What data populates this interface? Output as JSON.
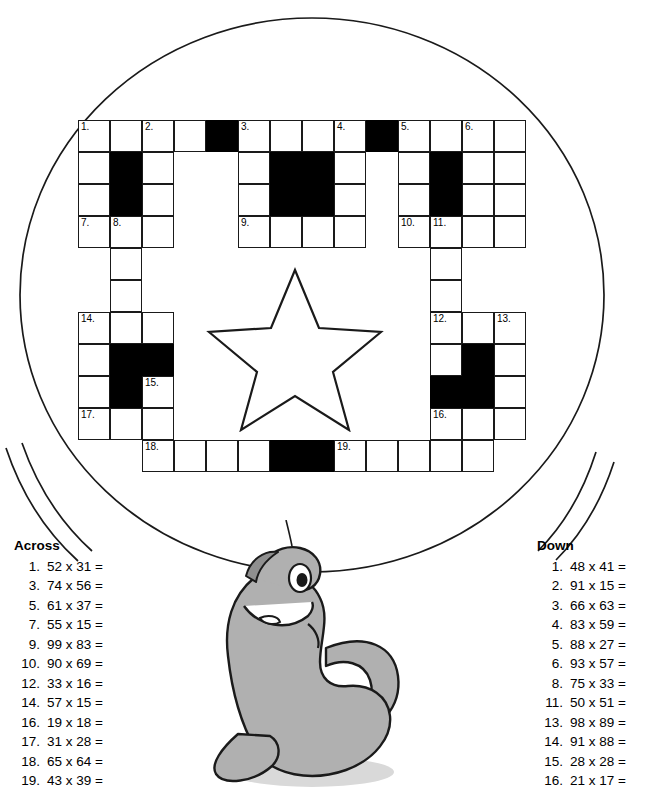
{
  "worksheet": {
    "across": {
      "heading": "Across",
      "clues": [
        {
          "n": "1.",
          "text": "52 x 31 ="
        },
        {
          "n": "3.",
          "text": "74 x 56 ="
        },
        {
          "n": "5.",
          "text": "61 x 37 ="
        },
        {
          "n": "7.",
          "text": "55 x 15 ="
        },
        {
          "n": "9.",
          "text": "99 x 83 ="
        },
        {
          "n": "10.",
          "text": "90 x 69 ="
        },
        {
          "n": "12.",
          "text": "33 x 16 ="
        },
        {
          "n": "14.",
          "text": "57 x 15 ="
        },
        {
          "n": "16.",
          "text": "19 x 18 ="
        },
        {
          "n": "17.",
          "text": "31 x 28 ="
        },
        {
          "n": "18.",
          "text": "65 x 64 ="
        },
        {
          "n": "19.",
          "text": "43 x 39 ="
        }
      ]
    },
    "down": {
      "heading": "Down",
      "clues": [
        {
          "n": "1.",
          "text": "48 x 41 ="
        },
        {
          "n": "2.",
          "text": "91 x 15 ="
        },
        {
          "n": "3.",
          "text": "66 x 63 ="
        },
        {
          "n": "4.",
          "text": "83 x 59 ="
        },
        {
          "n": "5.",
          "text": "88 x 27 ="
        },
        {
          "n": "6.",
          "text": "93 x 57 ="
        },
        {
          "n": "8.",
          "text": "75 x 33 ="
        },
        {
          "n": "11.",
          "text": "50 x 51 ="
        },
        {
          "n": "13.",
          "text": "98 x 89 ="
        },
        {
          "n": "14.",
          "text": "91 x 88 ="
        },
        {
          "n": "15.",
          "text": "28 x 28 ="
        },
        {
          "n": "16.",
          "text": "21 x 17 ="
        }
      ]
    }
  },
  "grid": {
    "origin_x": 78,
    "origin_y": 120,
    "cell": 32,
    "cols": 15,
    "rows": 11,
    "cells": [
      {
        "r": 0,
        "c": 0,
        "black": false,
        "num": "1."
      },
      {
        "r": 0,
        "c": 1,
        "black": false,
        "num": ""
      },
      {
        "r": 0,
        "c": 2,
        "black": false,
        "num": "2."
      },
      {
        "r": 0,
        "c": 3,
        "black": false,
        "num": ""
      },
      {
        "r": 0,
        "c": 4,
        "black": true,
        "num": ""
      },
      {
        "r": 0,
        "c": 5,
        "black": false,
        "num": "3."
      },
      {
        "r": 0,
        "c": 6,
        "black": false,
        "num": ""
      },
      {
        "r": 0,
        "c": 7,
        "black": false,
        "num": ""
      },
      {
        "r": 0,
        "c": 8,
        "black": false,
        "num": "4."
      },
      {
        "r": 0,
        "c": 9,
        "black": true,
        "num": ""
      },
      {
        "r": 0,
        "c": 10,
        "black": false,
        "num": "5."
      },
      {
        "r": 0,
        "c": 11,
        "black": false,
        "num": ""
      },
      {
        "r": 0,
        "c": 12,
        "black": false,
        "num": "6."
      },
      {
        "r": 0,
        "c": 13,
        "black": false,
        "num": ""
      },
      {
        "r": 1,
        "c": 0,
        "black": false,
        "num": ""
      },
      {
        "r": 1,
        "c": 1,
        "black": true,
        "num": ""
      },
      {
        "r": 1,
        "c": 2,
        "black": false,
        "num": ""
      },
      {
        "r": 1,
        "c": 5,
        "black": false,
        "num": ""
      },
      {
        "r": 1,
        "c": 6,
        "black": true,
        "num": ""
      },
      {
        "r": 1,
        "c": 7,
        "black": true,
        "num": ""
      },
      {
        "r": 1,
        "c": 8,
        "black": false,
        "num": ""
      },
      {
        "r": 1,
        "c": 10,
        "black": false,
        "num": ""
      },
      {
        "r": 1,
        "c": 11,
        "black": true,
        "num": ""
      },
      {
        "r": 1,
        "c": 12,
        "black": false,
        "num": ""
      },
      {
        "r": 1,
        "c": 13,
        "black": false,
        "num": ""
      },
      {
        "r": 2,
        "c": 0,
        "black": false,
        "num": ""
      },
      {
        "r": 2,
        "c": 1,
        "black": true,
        "num": ""
      },
      {
        "r": 2,
        "c": 2,
        "black": false,
        "num": ""
      },
      {
        "r": 2,
        "c": 5,
        "black": false,
        "num": ""
      },
      {
        "r": 2,
        "c": 6,
        "black": true,
        "num": ""
      },
      {
        "r": 2,
        "c": 7,
        "black": true,
        "num": ""
      },
      {
        "r": 2,
        "c": 8,
        "black": false,
        "num": ""
      },
      {
        "r": 2,
        "c": 10,
        "black": false,
        "num": ""
      },
      {
        "r": 2,
        "c": 11,
        "black": true,
        "num": ""
      },
      {
        "r": 2,
        "c": 12,
        "black": false,
        "num": ""
      },
      {
        "r": 2,
        "c": 13,
        "black": false,
        "num": ""
      },
      {
        "r": 3,
        "c": 0,
        "black": false,
        "num": "7."
      },
      {
        "r": 3,
        "c": 1,
        "black": false,
        "num": "8."
      },
      {
        "r": 3,
        "c": 2,
        "black": false,
        "num": ""
      },
      {
        "r": 3,
        "c": 5,
        "black": false,
        "num": "9."
      },
      {
        "r": 3,
        "c": 6,
        "black": false,
        "num": ""
      },
      {
        "r": 3,
        "c": 7,
        "black": false,
        "num": ""
      },
      {
        "r": 3,
        "c": 8,
        "black": false,
        "num": ""
      },
      {
        "r": 3,
        "c": 10,
        "black": false,
        "num": "10."
      },
      {
        "r": 3,
        "c": 11,
        "black": false,
        "num": "11."
      },
      {
        "r": 3,
        "c": 12,
        "black": false,
        "num": ""
      },
      {
        "r": 3,
        "c": 13,
        "black": false,
        "num": ""
      },
      {
        "r": 4,
        "c": 1,
        "black": false,
        "num": ""
      },
      {
        "r": 4,
        "c": 11,
        "black": false,
        "num": ""
      },
      {
        "r": 5,
        "c": 1,
        "black": false,
        "num": ""
      },
      {
        "r": 5,
        "c": 11,
        "black": false,
        "num": ""
      },
      {
        "r": 6,
        "c": 0,
        "black": false,
        "num": "14."
      },
      {
        "r": 6,
        "c": 1,
        "black": false,
        "num": ""
      },
      {
        "r": 6,
        "c": 2,
        "black": false,
        "num": ""
      },
      {
        "r": 6,
        "c": 11,
        "black": false,
        "num": "12."
      },
      {
        "r": 6,
        "c": 12,
        "black": false,
        "num": ""
      },
      {
        "r": 6,
        "c": 13,
        "black": false,
        "num": "13."
      },
      {
        "r": 7,
        "c": 0,
        "black": false,
        "num": ""
      },
      {
        "r": 7,
        "c": 1,
        "black": true,
        "num": ""
      },
      {
        "r": 7,
        "c": 2,
        "black": true,
        "num": ""
      },
      {
        "r": 7,
        "c": 11,
        "black": false,
        "num": ""
      },
      {
        "r": 7,
        "c": 12,
        "black": true,
        "num": ""
      },
      {
        "r": 7,
        "c": 13,
        "black": false,
        "num": ""
      },
      {
        "r": 8,
        "c": 0,
        "black": false,
        "num": ""
      },
      {
        "r": 8,
        "c": 1,
        "black": true,
        "num": ""
      },
      {
        "r": 8,
        "c": 2,
        "black": false,
        "num": "15."
      },
      {
        "r": 8,
        "c": 11,
        "black": true,
        "num": ""
      },
      {
        "r": 8,
        "c": 12,
        "black": true,
        "num": ""
      },
      {
        "r": 8,
        "c": 13,
        "black": false,
        "num": ""
      },
      {
        "r": 9,
        "c": 0,
        "black": false,
        "num": "17."
      },
      {
        "r": 9,
        "c": 1,
        "black": false,
        "num": ""
      },
      {
        "r": 9,
        "c": 2,
        "black": false,
        "num": ""
      },
      {
        "r": 9,
        "c": 11,
        "black": false,
        "num": "16."
      },
      {
        "r": 9,
        "c": 12,
        "black": false,
        "num": ""
      },
      {
        "r": 9,
        "c": 13,
        "black": false,
        "num": ""
      },
      {
        "r": 10,
        "c": 2,
        "black": false,
        "num": "18."
      },
      {
        "r": 10,
        "c": 3,
        "black": false,
        "num": ""
      },
      {
        "r": 10,
        "c": 4,
        "black": false,
        "num": ""
      },
      {
        "r": 10,
        "c": 5,
        "black": false,
        "num": ""
      },
      {
        "r": 10,
        "c": 6,
        "black": true,
        "num": ""
      },
      {
        "r": 10,
        "c": 7,
        "black": true,
        "num": ""
      },
      {
        "r": 10,
        "c": 8,
        "black": false,
        "num": "19."
      },
      {
        "r": 10,
        "c": 9,
        "black": false,
        "num": ""
      },
      {
        "r": 10,
        "c": 10,
        "black": false,
        "num": ""
      },
      {
        "r": 10,
        "c": 11,
        "black": false,
        "num": ""
      },
      {
        "r": 10,
        "c": 12,
        "black": false,
        "num": ""
      }
    ]
  },
  "colors": {
    "ink": "#000000",
    "paper": "#ffffff",
    "seal_body": "#a8a8a8",
    "seal_shadow": "#cfcfcf"
  }
}
